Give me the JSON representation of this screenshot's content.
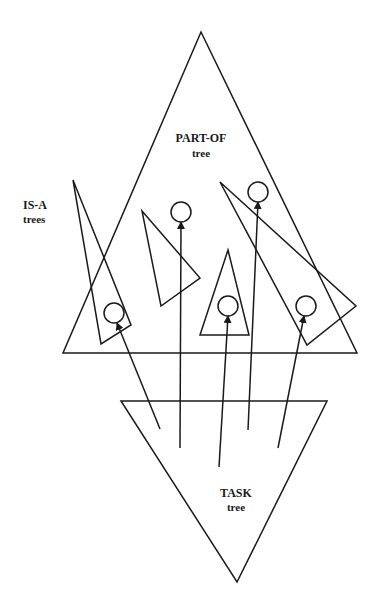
{
  "diagram": {
    "colors": {
      "stroke": "#1a1a1a",
      "background": "#ffffff"
    },
    "labels": {
      "part_of_title": "PART-OF",
      "part_of_sub": "tree",
      "is_a_title": "IS-A",
      "is_a_sub": "trees",
      "task_title": "TASK",
      "task_sub": "tree"
    },
    "trees": {
      "part_of": {
        "points": "201,32 357,353 63,353"
      },
      "task": {
        "points": "121,401 327,401 237,582"
      },
      "is_a": [
        {
          "id": "isa-1",
          "points": "73,180 131,325 101,344"
        },
        {
          "id": "isa-2",
          "points": "142,211 200,278 161,306"
        },
        {
          "id": "isa-3",
          "points": "228,250 249,335 200,335"
        },
        {
          "id": "isa-4",
          "points": "220,182 356,306 307,345"
        }
      ]
    },
    "nodes": [
      {
        "id": "node-1",
        "cx": 114,
        "cy": 313,
        "r": 10
      },
      {
        "id": "node-2",
        "cx": 181,
        "cy": 212,
        "r": 10
      },
      {
        "id": "node-3",
        "cx": 228,
        "cy": 306,
        "r": 10
      },
      {
        "id": "node-4",
        "cx": 258,
        "cy": 192,
        "r": 10
      },
      {
        "id": "node-5",
        "cx": 306,
        "cy": 306,
        "r": 10
      }
    ],
    "arrows": [
      {
        "from": [
          160,
          429
        ],
        "to": [
          117,
          323
        ],
        "target": "node-1"
      },
      {
        "from": [
          180,
          448
        ],
        "to": [
          181,
          222
        ],
        "target": "node-2"
      },
      {
        "from": [
          219,
          467
        ],
        "to": [
          228,
          316
        ],
        "target": "node-3"
      },
      {
        "from": [
          248,
          430
        ],
        "to": [
          258,
          202
        ],
        "target": "node-4"
      },
      {
        "from": [
          278,
          448
        ],
        "to": [
          304,
          316
        ],
        "target": "node-5"
      }
    ]
  }
}
